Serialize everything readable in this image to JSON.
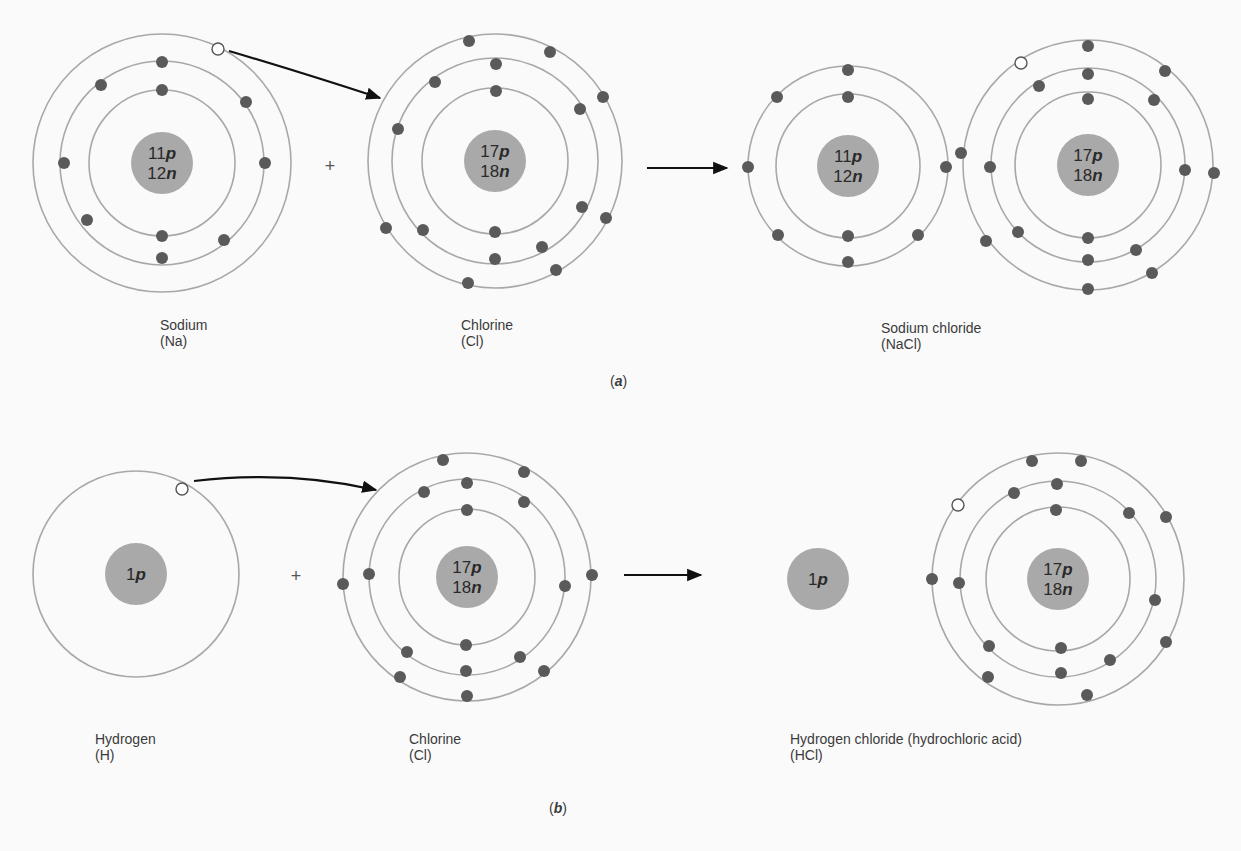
{
  "figure": {
    "parts": [
      {
        "id": "a",
        "caption_letter": "a",
        "caption_pos": [
          610,
          373
        ],
        "plus_pos": [
          330,
          172
        ],
        "transfer_arrow": {
          "from": [
            229,
            51
          ],
          "ctrl": [
            300,
            72
          ],
          "to": [
            380,
            98
          ]
        },
        "reaction_arrow": {
          "from": [
            647,
            168
          ],
          "to": [
            727,
            168
          ]
        },
        "atoms": [
          {
            "name": "Sodium",
            "symbol": "(Na)",
            "center": [
              162,
              163
            ],
            "nucleus_r": 31,
            "nucleus_lines": [
              {
                "num": "11",
                "unit": "p"
              },
              {
                "num": "12",
                "unit": "n"
              }
            ],
            "orbits": [
              73,
              102,
              129
            ],
            "electrons": [
              [
                162,
                90
              ],
              [
                162,
                236
              ],
              [
                162,
                62
              ],
              [
                246,
                102
              ],
              [
                265,
                163
              ],
              [
                224,
                240
              ],
              [
                162,
                258
              ],
              [
                87,
                220
              ],
              [
                64,
                163
              ],
              [
                101,
                85
              ]
            ],
            "holes": [
              [
                218,
                49
              ]
            ],
            "label_pos": [
              160,
              317
            ]
          },
          {
            "name": "Chlorine",
            "symbol": "(Cl)",
            "center": [
              495,
              161
            ],
            "nucleus_r": 31,
            "nucleus_lines": [
              {
                "num": "17",
                "unit": "p"
              },
              {
                "num": "18",
                "unit": "n"
              }
            ],
            "orbits": [
              73,
              103,
              127
            ],
            "electrons": [
              [
                496,
                91
              ],
              [
                495,
                232
              ],
              [
                496,
                64
              ],
              [
                580,
                109
              ],
              [
                582,
                207
              ],
              [
                542,
                247
              ],
              [
                495,
                259
              ],
              [
                423,
                230
              ],
              [
                398,
                129
              ],
              [
                435,
                82
              ],
              [
                469,
                41
              ],
              [
                550,
                52
              ],
              [
                603,
                97
              ],
              [
                606,
                218
              ],
              [
                556,
                270
              ],
              [
                468,
                283
              ],
              [
                386,
                228
              ]
            ],
            "holes": [],
            "label_pos": [
              461,
              317
            ]
          },
          {
            "name": "Sodium ion",
            "symbol": "",
            "center": [
              848,
              166
            ],
            "nucleus_r": 31,
            "nucleus_lines": [
              {
                "num": "11",
                "unit": "p"
              },
              {
                "num": "12",
                "unit": "n"
              }
            ],
            "orbits": [
              72,
              100
            ],
            "electrons": [
              [
                848,
                97
              ],
              [
                848,
                236
              ],
              [
                848,
                70
              ],
              [
                918,
                235
              ],
              [
                946,
                167
              ],
              [
                848,
                262
              ],
              [
                778,
                235
              ],
              [
                748,
                167
              ],
              [
                777,
                97
              ]
            ],
            "holes": [],
            "label_pos": null
          },
          {
            "name": "Chloride ion",
            "symbol": "",
            "center": [
              1088,
              165
            ],
            "nucleus_r": 31,
            "nucleus_lines": [
              {
                "num": "17",
                "unit": "p"
              },
              {
                "num": "18",
                "unit": "n"
              }
            ],
            "orbits": [
              73,
              97,
              125
            ],
            "electrons": [
              [
                1088,
                99
              ],
              [
                1088,
                238
              ],
              [
                1088,
                74
              ],
              [
                1154,
                100
              ],
              [
                1185,
                170
              ],
              [
                1136,
                250
              ],
              [
                1088,
                260
              ],
              [
                1018,
                232
              ],
              [
                990,
                167
              ],
              [
                1039,
                86
              ],
              [
                1088,
                46
              ],
              [
                1165,
                71
              ],
              [
                1214,
                173
              ],
              [
                1152,
                273
              ],
              [
                1088,
                289
              ],
              [
                986,
                241
              ],
              [
                961,
                153
              ]
            ],
            "holes": [
              [
                1021,
                63
              ]
            ],
            "label_pos": null
          }
        ],
        "product_label": {
          "name": "Sodium chloride",
          "symbol": "(NaCl)",
          "pos": [
            881,
            317
          ]
        }
      },
      {
        "id": "b",
        "caption_letter": "b",
        "caption_pos": [
          549,
          800
        ],
        "plus_pos": [
          296,
          582
        ],
        "transfer_arrow": {
          "from": [
            194,
            481
          ],
          "ctrl": [
            290,
            470
          ],
          "to": [
            376,
            490
          ]
        },
        "reaction_arrow": {
          "from": [
            624,
            575
          ],
          "to": [
            701,
            575
          ]
        },
        "atoms": [
          {
            "name": "Hydrogen",
            "symbol": "(H)",
            "center": [
              136,
              574
            ],
            "nucleus_r": 31,
            "nucleus_lines": [
              {
                "num": "1",
                "unit": "p"
              }
            ],
            "orbits": [
              103
            ],
            "electrons": [],
            "holes": [
              [
                182,
                489
              ]
            ],
            "label_pos": [
              95,
              734
            ]
          },
          {
            "name": "Chlorine",
            "symbol": "(Cl)",
            "center": [
              467,
              577
            ],
            "nucleus_r": 31,
            "nucleus_lines": [
              {
                "num": "17",
                "unit": "p"
              },
              {
                "num": "18",
                "unit": "n"
              }
            ],
            "orbits": [
              68,
              98,
              124
            ],
            "electrons": [
              [
                467,
                510
              ],
              [
                466,
                645
              ],
              [
                467,
                483
              ],
              [
                524,
                502
              ],
              [
                565,
                586
              ],
              [
                520,
                657
              ],
              [
                466,
                671
              ],
              [
                407,
                652
              ],
              [
                369,
                574
              ],
              [
                424,
                492
              ],
              [
                443,
                460
              ],
              [
                524,
                472
              ],
              [
                592,
                575
              ],
              [
                544,
                671
              ],
              [
                467,
                696
              ],
              [
                400,
                677
              ],
              [
                343,
                584
              ]
            ],
            "holes": [],
            "label_pos": [
              409,
              734
            ]
          },
          {
            "name": "Hydrogen ion",
            "symbol": "",
            "center": [
              818,
              579
            ],
            "nucleus_r": 31,
            "nucleus_lines": [
              {
                "num": "1",
                "unit": "p"
              }
            ],
            "orbits": [],
            "electrons": [],
            "holes": [],
            "label_pos": null
          },
          {
            "name": "Chlorine in HCl",
            "symbol": "",
            "center": [
              1058,
              579
            ],
            "nucleus_r": 31,
            "nucleus_lines": [
              {
                "num": "17",
                "unit": "p"
              },
              {
                "num": "18",
                "unit": "n"
              }
            ],
            "orbits": [
              72,
              98,
              126
            ],
            "electrons": [
              [
                1056,
                510
              ],
              [
                1061,
                648
              ],
              [
                1057,
                484
              ],
              [
                1129,
                513
              ],
              [
                1155,
                600
              ],
              [
                1110,
                660
              ],
              [
                1061,
                673
              ],
              [
                989,
                646
              ],
              [
                959,
                583
              ],
              [
                1014,
                493
              ],
              [
                1032,
                461
              ],
              [
                1081,
                461
              ],
              [
                1166,
                517
              ],
              [
                1166,
                642
              ],
              [
                1087,
                695
              ],
              [
                988,
                677
              ],
              [
                932,
                579
              ]
            ],
            "holes": [
              [
                958,
                505
              ]
            ],
            "label_pos": null
          }
        ],
        "product_label": {
          "name": "Hydrogen chloride (hydrochloric acid)",
          "symbol": "(HCl)",
          "pos": [
            790,
            734
          ]
        }
      }
    ]
  },
  "labels": {
    "a_sodium_name": "Sodium",
    "a_sodium_symbol": "(Na)",
    "a_chlorine_name": "Chlorine",
    "a_chlorine_symbol": "(Cl)",
    "a_product_name": "Sodium chloride",
    "a_product_symbol": "(NaCl)",
    "a_caption": "a",
    "b_hydrogen_name": "Hydrogen",
    "b_hydrogen_symbol": "(H)",
    "b_chlorine_name": "Chlorine",
    "b_chlorine_symbol": "(Cl)",
    "b_product_name": "Hydrogen chloride (hydrochloric acid)",
    "b_product_symbol": "(HCl)",
    "b_caption": "b",
    "plus_sign": "+"
  },
  "colors": {
    "background": "#fafafa",
    "orbit": "#a8a8a8",
    "nucleus": "#a9a9a9",
    "electron": "#5a5a5a",
    "arrow": "#111111",
    "text": "#3a3a3a"
  }
}
